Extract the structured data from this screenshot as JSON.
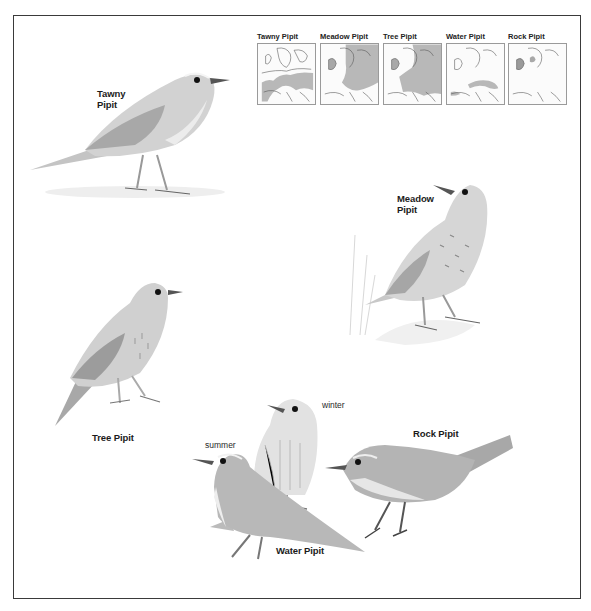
{
  "maps": [
    {
      "title": "Tawny Pipit",
      "range": "southern-central-europe"
    },
    {
      "title": "Meadow Pipit",
      "range": "northern-europe-britain"
    },
    {
      "title": "Tree Pipit",
      "range": "most-of-europe"
    },
    {
      "title": "Water Pipit",
      "range": "southern-mountains"
    },
    {
      "title": "Rock Pipit",
      "range": "coastal-britain-scandinavia"
    }
  ],
  "birds": {
    "tawny": {
      "label_line1": "Tawny",
      "label_line2": "Pipit"
    },
    "meadow": {
      "label_line1": "Meadow",
      "label_line2": "Pipit"
    },
    "tree": {
      "label": "Tree Pipit"
    },
    "water": {
      "label": "Water Pipit",
      "summer_label": "summer",
      "winter_label": "winter"
    },
    "rock": {
      "label": "Rock Pipit"
    }
  },
  "colors": {
    "frame": "#3a3a3a",
    "range_fill": "#b8b8b8",
    "bird_body": "#cfcfcf",
    "bird_dark": "#8a8a8a"
  }
}
